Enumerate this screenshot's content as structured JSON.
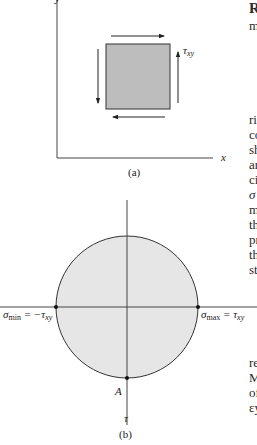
{
  "figure_a": {
    "caption": "(a)",
    "x_axis_label": "x",
    "y_axis_label": "y",
    "shear_label": "τ",
    "shear_subscript": "xy",
    "element_fill": "#bdbdbd"
  },
  "figure_b": {
    "caption": "(b)",
    "vertical_axis_label": "τ",
    "point_label": "A",
    "left_label_main": "σ",
    "left_label_sub": "min",
    "left_label_rest": " = −τ",
    "left_label_rest_sub": "xy",
    "right_label_main": "σ",
    "right_label_sub": "max",
    "right_label_rest": " = τ",
    "right_label_rest_sub": "xy",
    "circle_fill": "#e6e6e6"
  },
  "right_column_fragments": [
    {
      "text": "R",
      "top": 2,
      "bold": true
    },
    {
      "text": "m",
      "top": 19
    },
    {
      "text": "ri",
      "top": 113
    },
    {
      "text": "co",
      "top": 128
    },
    {
      "text": "sh",
      "top": 143
    },
    {
      "text": "ar",
      "top": 158
    },
    {
      "text": "ci",
      "top": 173
    },
    {
      "text": "σ",
      "top": 188,
      "italic": true
    },
    {
      "text": "m",
      "top": 203
    },
    {
      "text": "th",
      "top": 218
    },
    {
      "text": "pr",
      "top": 233
    },
    {
      "text": "th",
      "top": 248
    },
    {
      "text": "st",
      "top": 263
    },
    {
      "text": "re",
      "top": 356
    },
    {
      "text": "M",
      "top": 371
    },
    {
      "text": "of",
      "top": 386
    },
    {
      "text": "εy",
      "top": 401
    }
  ]
}
